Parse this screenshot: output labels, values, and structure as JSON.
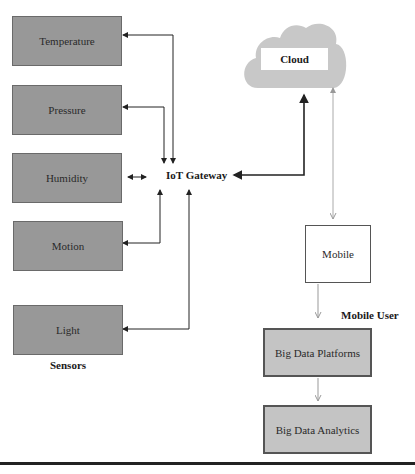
{
  "sensors": {
    "group_label": "Sensors",
    "items": [
      {
        "label": "Temperature"
      },
      {
        "label": "Pressure"
      },
      {
        "label": "Humidity"
      },
      {
        "label": "Motion"
      },
      {
        "label": "Light"
      }
    ]
  },
  "gateway": {
    "label": "IoT Gateway"
  },
  "cloud": {
    "label": "Cloud"
  },
  "mobile": {
    "label": "Mobile",
    "group_label": "Mobile User"
  },
  "big_data": {
    "platforms": "Big Data Platforms",
    "analytics": "Big Data Analytics"
  },
  "colors": {
    "sensor_fill": "#989898",
    "bigdata_fill": "#c4c4c4",
    "cloud_fill": "#c8c8c8",
    "connector": "#222222",
    "mobile_connector": "#a8a8a8"
  }
}
